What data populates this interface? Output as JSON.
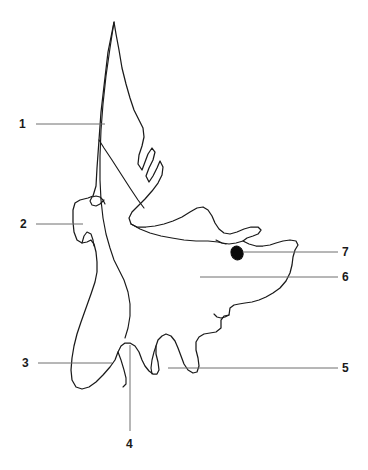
{
  "figure": {
    "width": 368,
    "height": 470,
    "background_color": "#ffffff",
    "outline_color": "#1a1a1a",
    "leader_line_color": "#6e6e6e",
    "foramen_color": "#0b0b0b",
    "style": "black and white unlabeled line drawing with numbered leader lines"
  },
  "labels": [
    {
      "id": "1",
      "text": "1",
      "text_x": 19,
      "text_y": 118,
      "leader": {
        "x1": 36,
        "y1": 124,
        "x2": 105,
        "y2": 124
      },
      "side": "left"
    },
    {
      "id": "2",
      "text": "2",
      "text_x": 20,
      "text_y": 218,
      "leader": {
        "x1": 36,
        "y1": 224,
        "x2": 83,
        "y2": 224
      },
      "side": "left"
    },
    {
      "id": "3",
      "text": "3",
      "text_x": 22,
      "text_y": 357,
      "leader": {
        "x1": 38,
        "y1": 363,
        "x2": 112,
        "y2": 363
      },
      "side": "left"
    },
    {
      "id": "4",
      "text": "4",
      "text_x": 126,
      "text_y": 438,
      "leader": {
        "x1": 130,
        "y1": 345,
        "x2": 130,
        "y2": 431
      },
      "side": "bottom"
    },
    {
      "id": "5",
      "text": "5",
      "text_x": 342,
      "text_y": 362,
      "leader": {
        "x1": 168,
        "y1": 368,
        "x2": 338,
        "y2": 368
      },
      "side": "right"
    },
    {
      "id": "6",
      "text": "6",
      "text_x": 342,
      "text_y": 271,
      "leader": {
        "x1": 200,
        "y1": 277,
        "x2": 338,
        "y2": 277
      },
      "side": "right"
    },
    {
      "id": "7",
      "text": "7",
      "text_x": 342,
      "text_y": 246,
      "leader": {
        "x1": 243,
        "y1": 252,
        "x2": 338,
        "y2": 252
      },
      "side": "right"
    }
  ],
  "shapes": {
    "bone_outline_path": "M114,22 L108,52 L104,86 L101,112 L99,140 L97,168 L96,186 L93,196 L88,198 L80,200 L75,203 L73,210 L73,222 L74,232 L77,240 L82,243 L87,242 L91,240 L94,244 L96,252 L97,262 L97,272 L95,282 L91,294 L86,308 L81,322 L77,334 L74,346 L72,358 L71,370 L72,380 L76,387 L82,389 L89,387 L96,382 L103,375 L110,367 L115,360 L118,352 L121,346 L125,343 L130,343 L135,346 L139,352 L142,360 L145,366 L149,371 L153,374 L157,374 L159,370 L158,362 L156,354 L156,346 L158,340 L162,336 L166,334 L171,336 L175,341 L178,348 L181,356 L184,364 L188,370 L193,373 L197,372 L199,366 L198,358 L196,350 L196,342 L199,337 L204,334 L210,333 L216,332 L221,328 L221,320 L224,316 L229,315 L230,308 L234,305 L239,304 L245,303 L252,302 L259,300 L266,297 L273,293 L280,288 L286,281 L290,273 L292,265 L293,257 L295,250 L298,245 L296,241 L290,240 L283,241 L276,243 L270,245 L263,246 L256,246 L249,244 L243,241 L247,238 L253,236 L258,234 L261,230 L258,227 L251,227 L244,229 L237,232 L230,234 L224,233 L219,229 L215,223 L212,216 L208,210 L203,207 L197,208 L190,212 L182,217 L173,221 L164,224 L155,226 L146,227 L137,227 L131,224 L129,218 L132,212 L138,206 L145,199 L152,191 L158,183 L162,175 L163,167 L160,161 L157,168 L153,176 L149,182 L146,176 L149,168 L153,160 L155,152 L152,148 L148,154 L145,162 L142,170 L138,164 L139,155 L142,146 L144,137 L143,128 L139,120 L134,110 L130,98 L126,84 L122,68 L119,50 L116,34 Z",
    "bone_inner_path": "M114,22 L110,48 L106,76 L103,104 L101,130 L100,156 L100,180 L101,200 L103,218 L106,234 L110,248 L114,260 L119,270 L124,280 L128,292 L130,304 L130,316 L128,328 L125,338",
    "bone_detail_paths": [
      "M99,140 L104,148 L112,160 L121,174 L130,188 L138,200 L144,208",
      "M131,224 L140,229 L150,233 L161,236 L172,238 L184,240 L196,241 L208,241 L218,242 L226,244",
      "M104,200 L100,204 L96,206 L92,205 L90,201 L92,197 L96,196 L100,197 L103,200 L105,204",
      "M82,243 L84,236 L87,232 L91,234 L93,240 L94,246",
      "M243,241 L236,243 L229,244 L222,243 L216,240",
      "M229,315 L225,317 L221,318 L217,317 L214,314",
      "M118,352 L121,360 L124,370 L126,378 L126,384 L123,387",
      "M156,346 L154,352 L152,360 L151,368 L152,374"
    ],
    "foramen": {
      "cx": 237,
      "cy": 253,
      "rx": 6,
      "ry": 7,
      "rotation": -20
    }
  }
}
